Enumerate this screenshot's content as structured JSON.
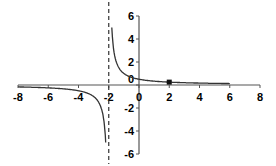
{
  "chart_data": {
    "type": "line",
    "title": "",
    "xlabel": "",
    "ylabel": "",
    "function": "y = 1/(x+2)",
    "xlim": [
      -8,
      8
    ],
    "ylim": [
      -6,
      6
    ],
    "grid": false,
    "legend": null,
    "x_ticks": [
      -8,
      -6,
      -4,
      -2,
      0,
      2,
      4,
      6,
      8
    ],
    "y_ticks": [
      -6,
      -4,
      -2,
      0,
      2,
      4,
      6
    ],
    "x_tick_labels": [
      "-8",
      "-6",
      "-4",
      "-2",
      "0",
      "2",
      "4",
      "6",
      "8"
    ],
    "y_tick_labels": [
      "-6",
      "-4",
      "-2",
      "0",
      "2",
      "4",
      "6"
    ],
    "asymptote": {
      "type": "vertical",
      "x": -2,
      "style": "dashed"
    },
    "series": [
      {
        "name": "left branch",
        "x": [
          -8,
          -7,
          -6,
          -5,
          -4,
          -3,
          -2.5,
          -2.3,
          -2.2
        ],
        "y": [
          -0.167,
          -0.2,
          -0.25,
          -0.333,
          -0.5,
          -1,
          -2,
          -3.33,
          -5
        ]
      },
      {
        "name": "right branch",
        "x": [
          -1.8,
          -1.7,
          -1.5,
          -1,
          0,
          1,
          2,
          3,
          4,
          5,
          6
        ],
        "y": [
          5,
          3.33,
          2,
          1,
          0.5,
          0.333,
          0.25,
          0.2,
          0.167,
          0.143,
          0.125
        ]
      }
    ],
    "marked_points": [
      {
        "x": 2,
        "y": 0.25,
        "marker": "square"
      }
    ]
  }
}
